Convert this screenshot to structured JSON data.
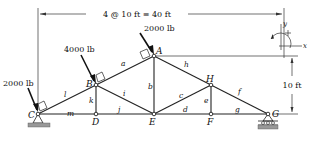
{
  "diagram": {
    "type": "plane truss",
    "top_dimension": "4 @ 10 ft ≡ 40 ft",
    "height_dimension": "10 ft",
    "nodes": [
      {
        "name": "A",
        "x": 154,
        "y": 56
      },
      {
        "name": "B",
        "x": 96,
        "y": 85
      },
      {
        "name": "C",
        "x": 38,
        "y": 114
      },
      {
        "name": "D",
        "x": 96,
        "y": 114
      },
      {
        "name": "E",
        "x": 154,
        "y": 114
      },
      {
        "name": "F",
        "x": 211,
        "y": 114
      },
      {
        "name": "G",
        "x": 268,
        "y": 114
      },
      {
        "name": "H",
        "x": 211,
        "y": 85
      }
    ],
    "members": [
      {
        "label": "a",
        "from": "B",
        "to": "A"
      },
      {
        "label": "b",
        "from": "A",
        "to": "E"
      },
      {
        "label": "c",
        "from": "E",
        "to": "H"
      },
      {
        "label": "d",
        "from": "E",
        "to": "F"
      },
      {
        "label": "e",
        "from": "H",
        "to": "F"
      },
      {
        "label": "f",
        "from": "H",
        "to": "G"
      },
      {
        "label": "g",
        "from": "F",
        "to": "G"
      },
      {
        "label": "h",
        "from": "A",
        "to": "H"
      },
      {
        "label": "i",
        "from": "B",
        "to": "E"
      },
      {
        "label": "j",
        "from": "D",
        "to": "E"
      },
      {
        "label": "k",
        "from": "B",
        "to": "D"
      },
      {
        "label": "l",
        "from": "C",
        "to": "B"
      },
      {
        "label": "m",
        "from": "C",
        "to": "D"
      }
    ],
    "loads": [
      {
        "node": "C",
        "label": "2000 lb"
      },
      {
        "node": "B",
        "label": "4000 lb"
      },
      {
        "node": "A",
        "label": "2000 lb"
      }
    ],
    "supports": [
      {
        "node": "C",
        "type": "pin"
      },
      {
        "node": "G",
        "type": "roller"
      }
    ],
    "sign_convention": {
      "x_axis": "x",
      "y_axis": "y",
      "positive_moment": "+"
    }
  }
}
